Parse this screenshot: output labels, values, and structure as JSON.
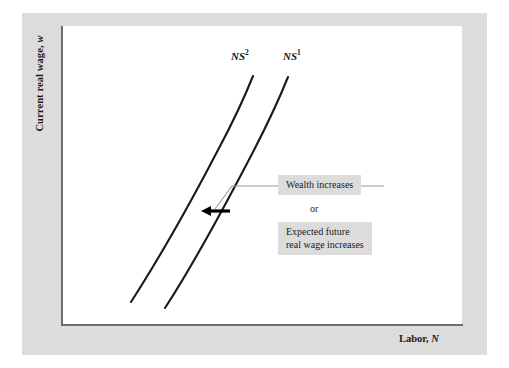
{
  "figure": {
    "kind": "economics-line-diagram",
    "frame_color": "#dcdcdc",
    "panel_color": "#ffffff",
    "axis_color": "#6e6e6e",
    "curve_color": "#1a1a1a",
    "connector_color": "#9a9a9a",
    "arrow_color": "#000000"
  },
  "axes": {
    "y_title_text": "Current real wage, ",
    "y_title_var": "w",
    "x_title_text": "Labor, ",
    "x_title_var": "N"
  },
  "curves": [
    {
      "id": "ns2",
      "base_label": "NS",
      "superscript": "2",
      "label_x": 231,
      "label_y": 50,
      "path": "M 131 302 C 158 260 192 200 218 150 C 233 122 245 96 253 76"
    },
    {
      "id": "ns1",
      "base_label": "NS",
      "superscript": "1",
      "label_x": 283,
      "label_y": 50,
      "path": "M 165 308 C 193 265 227 202 253 152 C 268 123 280 97 288 77"
    }
  ],
  "annotations": {
    "wealth": "Wealth increases",
    "or": "or",
    "expected_line1": "Expected future",
    "expected_line2": "real wage increases"
  },
  "connector": {
    "polyline": "384,186 232,186 215,209",
    "arrow_tail_x": 230,
    "arrow_tip_x": 201,
    "arrow_y": 211
  },
  "chart_data": {
    "type": "line",
    "title": "",
    "xlabel": "Labor, N",
    "ylabel": "Current real wage, w",
    "grid": false,
    "legend": "inline-curve-labels",
    "axis_ticks": [],
    "xlim": [
      0,
      1
    ],
    "ylim": [
      0,
      1
    ],
    "series": [
      {
        "name": "NS2",
        "description": "Labor supply curve after leftward shift",
        "points_px": [
          [
            131,
            302
          ],
          [
            160,
            258
          ],
          [
            190,
            203
          ],
          [
            218,
            150
          ],
          [
            238,
            112
          ],
          [
            253,
            76
          ]
        ]
      },
      {
        "name": "NS1",
        "description": "Original labor supply curve",
        "points_px": [
          [
            165,
            308
          ],
          [
            195,
            262
          ],
          [
            225,
            206
          ],
          [
            253,
            152
          ],
          [
            273,
            113
          ],
          [
            288,
            77
          ]
        ]
      }
    ],
    "annotations": [
      "Wealth increases",
      "or",
      "Expected future real wage increases"
    ],
    "shift_direction": "leftward",
    "note": "Upward-sloping labor supply curve NS1 shifts left to NS2"
  }
}
